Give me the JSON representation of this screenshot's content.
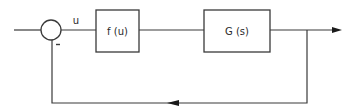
{
  "diagram": {
    "type": "block-diagram",
    "blocks": [
      {
        "id": "nonlinearity",
        "label": "f (u)"
      },
      {
        "id": "plant",
        "label": "G (s)"
      }
    ],
    "summing_junction": {
      "id": "sum",
      "feedback_sign": "-"
    },
    "signals": {
      "error_label": "u"
    },
    "connections": [
      {
        "from": "input",
        "to": "sum"
      },
      {
        "from": "sum",
        "to": "nonlinearity",
        "label": "u"
      },
      {
        "from": "nonlinearity",
        "to": "plant"
      },
      {
        "from": "plant",
        "to": "output"
      },
      {
        "from": "output",
        "to": "sum",
        "type": "feedback",
        "sign": "-"
      }
    ],
    "colors": {
      "line": "#3a3a3a",
      "arrow": "#1a1a1a",
      "background": "#ffffff"
    }
  }
}
